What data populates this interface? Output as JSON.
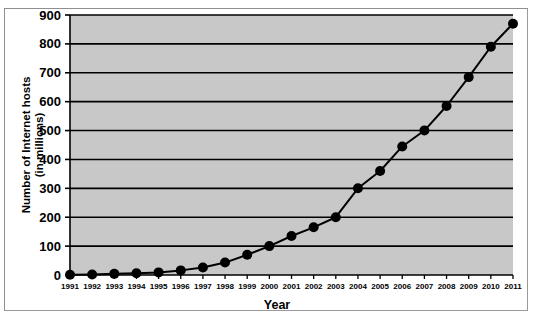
{
  "chart_data": {
    "type": "line",
    "title": "",
    "xlabel": "Year",
    "ylabel_line1": "Number of Internet hosts",
    "ylabel_line2": "(in millions)",
    "categories": [
      "1991",
      "1992",
      "1993",
      "1994",
      "1995",
      "1996",
      "1997",
      "1998",
      "1999",
      "2000",
      "2001",
      "2002",
      "2003",
      "2004",
      "2005",
      "2006",
      "2007",
      "2008",
      "2009",
      "2010",
      "2011"
    ],
    "values": [
      1,
      2,
      4,
      6,
      9,
      16,
      26,
      43,
      70,
      100,
      135,
      165,
      200,
      300,
      360,
      445,
      500,
      585,
      685,
      790,
      870
    ],
    "series": [
      {
        "name": "Number of Internet hosts (in millions)",
        "values": [
          1,
          2,
          4,
          6,
          9,
          16,
          26,
          43,
          70,
          100,
          135,
          165,
          200,
          300,
          360,
          445,
          500,
          585,
          685,
          790,
          870
        ]
      }
    ],
    "ylim": [
      0,
      900
    ],
    "yticks": [
      0,
      100,
      200,
      300,
      400,
      500,
      600,
      700,
      800,
      900
    ],
    "ytick_labels": [
      "0",
      "100",
      "200",
      "300",
      "400",
      "500",
      "600",
      "700",
      "800",
      "900"
    ],
    "grid": true,
    "grid_axis": "y",
    "legend": false,
    "legend_position": "none",
    "colors": {
      "plot_background": "#c8c8c8",
      "figure_background": "#ffffff",
      "line": "#000000",
      "marker": "#000000",
      "gridline": "#000000",
      "axis": "#000000",
      "frame_border": "#9a9a9a"
    },
    "marker": "circle",
    "marker_size": 5,
    "line_width": 2
  }
}
